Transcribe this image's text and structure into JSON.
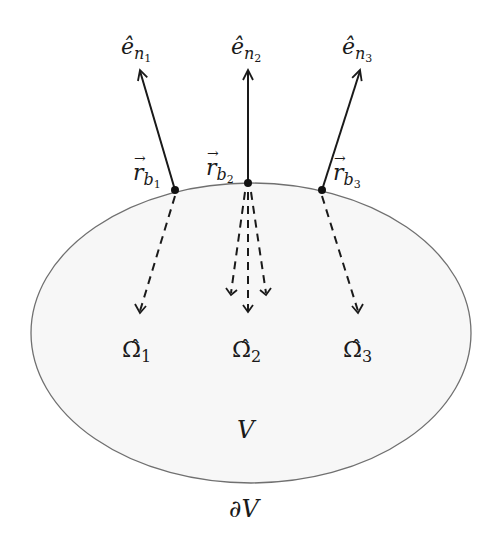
{
  "diagram": {
    "domain": {
      "interior_label": "V",
      "boundary_label": "∂V",
      "fill": "#f7f7f7",
      "stroke": "#707070"
    },
    "boundary_points": [
      {
        "id": 1,
        "position_label_base": "r",
        "position_label_sub": "b",
        "position_label_subsub": "1",
        "normal_label_base": "ê",
        "normal_label_sub": "n",
        "normal_label_subsub": "1",
        "direction_label_base": "Ω̂",
        "direction_label_sub": "1"
      },
      {
        "id": 2,
        "position_label_base": "r",
        "position_label_sub": "b",
        "position_label_subsub": "2",
        "normal_label_base": "ê",
        "normal_label_sub": "n",
        "normal_label_subsub": "2",
        "direction_label_base": "Ω̂",
        "direction_label_sub": "2"
      },
      {
        "id": 3,
        "position_label_base": "r",
        "position_label_sub": "b",
        "position_label_subsub": "3",
        "normal_label_base": "ê",
        "normal_label_sub": "n",
        "normal_label_subsub": "3",
        "direction_label_base": "Ω̂",
        "direction_label_sub": "3"
      }
    ],
    "vector_arrow": "→",
    "line_color": "#1a1a1a"
  }
}
